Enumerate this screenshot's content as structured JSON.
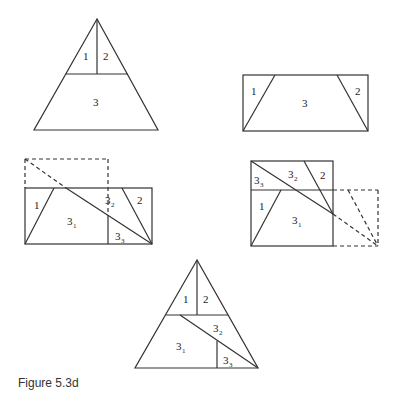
{
  "caption": "Figure 5.3d",
  "panels": {
    "triangle_top": {
      "labels": [
        "1",
        "2",
        "3"
      ]
    },
    "rectangle_top": {
      "labels": [
        "1",
        "3",
        "2"
      ]
    },
    "rect_mid_left": {
      "labels": [
        "1",
        "3",
        "1",
        "3",
        "2",
        "2",
        "3",
        "3"
      ]
    },
    "square_mid_right": {
      "labels": [
        "3",
        "3",
        "3",
        "2",
        "2",
        "1",
        "3",
        "1"
      ]
    },
    "triangle_bottom": {
      "labels": [
        "1",
        "2",
        "3",
        "2",
        "3",
        "1",
        "3",
        "3"
      ]
    }
  },
  "colors": {
    "stroke": "#333333",
    "background": "#ffffff"
  }
}
